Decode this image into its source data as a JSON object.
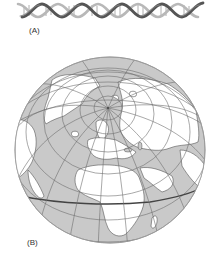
{
  "figure": {
    "panels": [
      {
        "id": "A",
        "label": "(A)",
        "subject": "DNA double helix"
      },
      {
        "id": "B",
        "label": "(B)",
        "subject": "Globe (orthographic view, Northern Hemisphere centered near North Pole, showing Eurasia, Africa, North America, Greenland)"
      }
    ],
    "colors": {
      "ocean": "#c9c9c9",
      "land": "#ffffff",
      "grid": "#6e6e6e",
      "coast": "#555555",
      "helix_dark": "#3c3c3c",
      "helix_mid": "#8a8a8a",
      "helix_light": "#c4c4c4",
      "equator": "#444444"
    }
  }
}
